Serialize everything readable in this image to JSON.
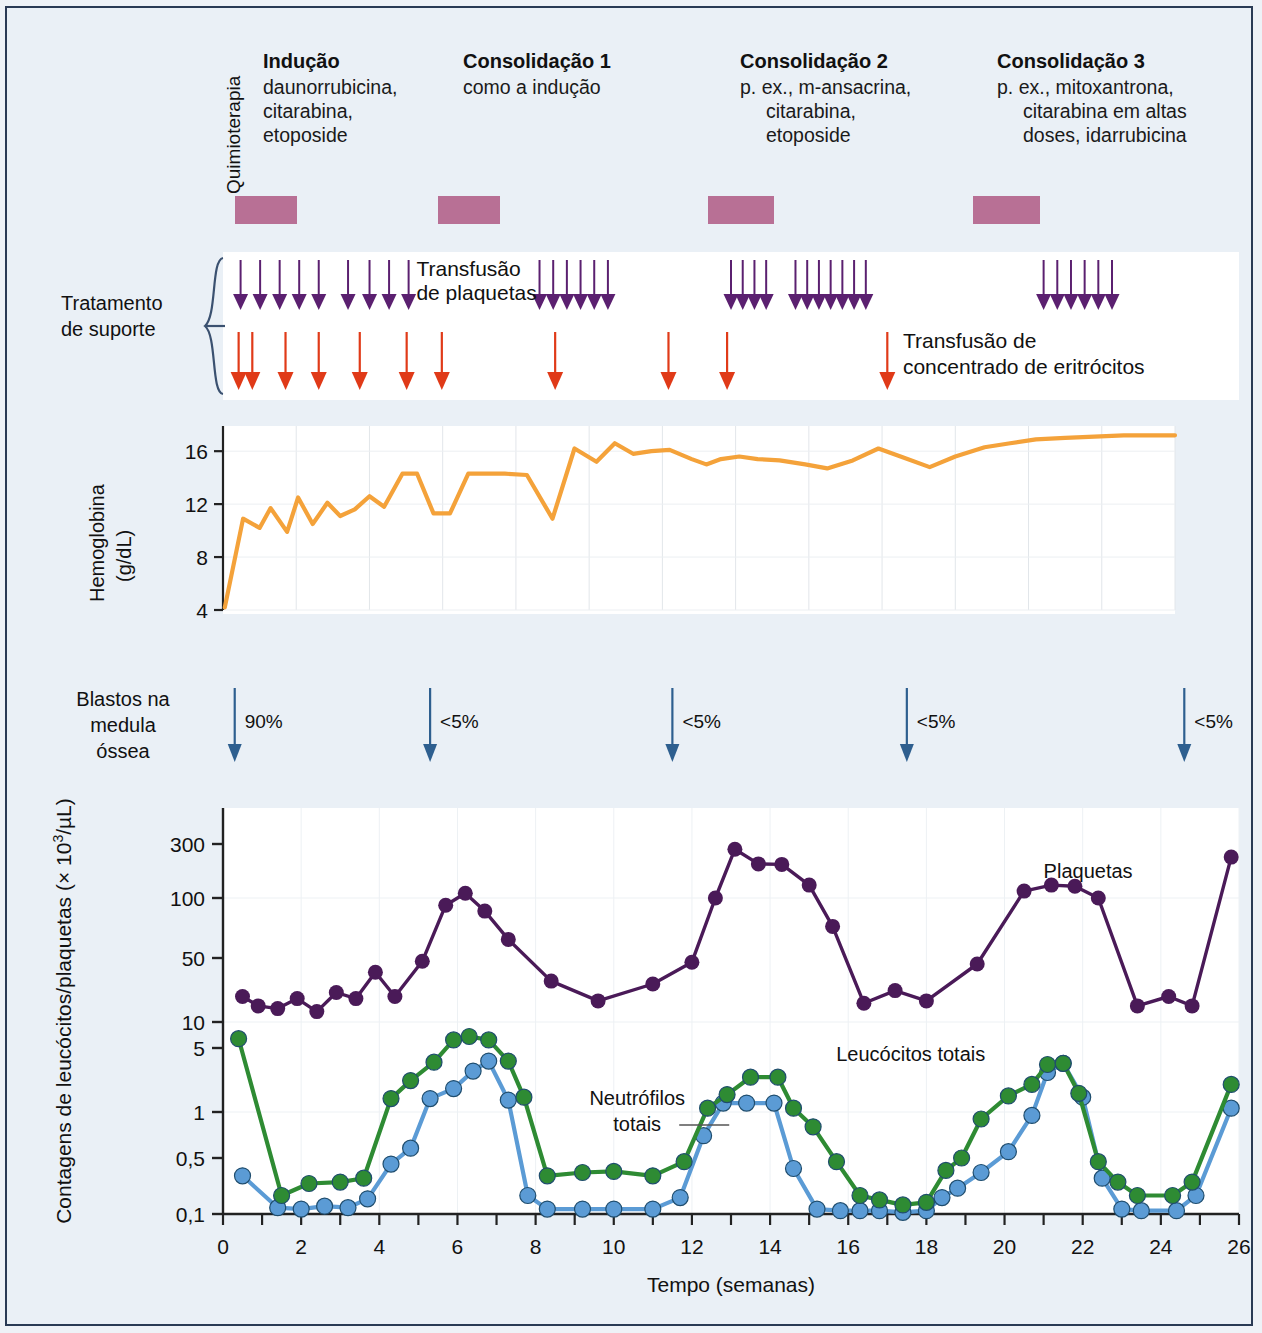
{
  "figure": {
    "background": "#eaf0f6",
    "border_color": "#2a3b55"
  },
  "chemo_section": {
    "axis_label": "Quimioterapia",
    "bar_color": "#b5688f",
    "cycles": [
      {
        "title": "Indução",
        "lines": [
          "daunorrubicina,",
          "citarabina,",
          "etoposide"
        ],
        "align": "left",
        "week_start": 0.3,
        "week_end": 1.9
      },
      {
        "title": "Consolidação 1",
        "lines": [
          "como a indução"
        ],
        "align": "left",
        "week_start": 5.5,
        "week_end": 7.1
      },
      {
        "title": "Consolidação 2",
        "lines": [
          "p. ex., m-ansacrina,",
          "citarabina,",
          "etoposide"
        ],
        "align": "right",
        "week_start": 12.4,
        "week_end": 14.1
      },
      {
        "title": "Consolidação 3",
        "lines": [
          "p. ex., mitoxantrona,",
          "citarabina em altas",
          "doses, idarrubicina"
        ],
        "align": "right",
        "week_start": 19.2,
        "week_end": 20.9
      }
    ]
  },
  "support_section": {
    "label_lines": [
      "Tratamento",
      "de suporte"
    ],
    "platelet": {
      "legend_lines": [
        "Transfusão",
        "de plaquetas"
      ],
      "color": "#5b2070",
      "weeks": [
        0.45,
        0.95,
        1.45,
        1.95,
        2.45,
        3.2,
        3.75,
        4.25,
        4.75,
        8.1,
        8.45,
        8.8,
        9.15,
        9.5,
        9.85,
        13.0,
        13.3,
        13.6,
        13.9,
        14.65,
        14.95,
        15.25,
        15.55,
        15.85,
        16.15,
        16.45,
        21.0,
        21.35,
        21.7,
        22.05,
        22.4,
        22.75
      ]
    },
    "erythrocyte": {
      "legend_lines": [
        "Transfusão de",
        "concentrado de eritrócitos"
      ],
      "color": "#e03a18",
      "weeks": [
        0.4,
        0.75,
        1.6,
        2.45,
        3.5,
        4.7,
        5.6,
        8.5,
        11.4,
        12.9
      ]
    }
  },
  "hemoglobin_chart": {
    "axis_label_lines": [
      "Hemoglobina",
      "(g/dL)"
    ],
    "line_color": "#f4a23a",
    "yticks": [
      4,
      8,
      12,
      16
    ],
    "ylim": [
      4,
      17.6
    ],
    "xlim": [
      0,
      26
    ]
  },
  "blast_section": {
    "label_lines": [
      "Blastos na",
      "medula",
      "óssea"
    ],
    "arrow_color": "#2e5f8f",
    "markers": [
      {
        "week": 0.3,
        "value": "90%"
      },
      {
        "week": 5.3,
        "value": "<5%"
      },
      {
        "week": 11.5,
        "value": "<5%"
      },
      {
        "week": 17.5,
        "value": "<5%"
      },
      {
        "week": 24.6,
        "value": "<5%"
      }
    ]
  },
  "chart_data": {
    "type": "line",
    "title": "",
    "xlabel": "Tempo (semanas)",
    "ylabel": "Contagens de leucócitos/plaquetas (× 10³/µL)",
    "ylabel_main": "Contagens de leucócitos/plaquetas (",
    "ylabel_sup": "3",
    "ylabel_tail": "/µL)",
    "yscale": "log",
    "ylim": [
      0.1,
      300
    ],
    "yticks": [
      0.1,
      0.5,
      1,
      5,
      10,
      50,
      100,
      300
    ],
    "yticklabels": [
      "0,1",
      "0,5",
      "1",
      "5",
      "10",
      "50",
      "100",
      "300"
    ],
    "xlim": [
      0,
      26
    ],
    "xticks": [
      0,
      1,
      2,
      3,
      4,
      5,
      6,
      7,
      8,
      9,
      10,
      11,
      12,
      13,
      14,
      15,
      16,
      17,
      18,
      19,
      20,
      21,
      22,
      23,
      24,
      25,
      26
    ],
    "xticklabels": [
      "0",
      "",
      "2",
      "",
      "4",
      "",
      "6",
      "",
      "8",
      "",
      "10",
      "",
      "12",
      "",
      "14",
      "",
      "16",
      "",
      "18",
      "",
      "20",
      "",
      "22",
      "",
      "24",
      "",
      "26"
    ],
    "grid": true,
    "legend_position": "inline-annotations",
    "series": [
      {
        "name": "Plaquetas",
        "color": "#4a1a58",
        "label_week": 21.0,
        "label_value": 150,
        "x": [
          0.5,
          0.9,
          1.4,
          1.9,
          2.4,
          2.9,
          3.4,
          3.9,
          4.4,
          5.1,
          5.7,
          6.2,
          6.7,
          7.3,
          8.4,
          9.6,
          11.0,
          12.0,
          12.6,
          13.1,
          13.7,
          14.3,
          15.0,
          15.6,
          16.4,
          17.2,
          18.0,
          19.3,
          20.5,
          21.2,
          21.8,
          22.4,
          23.4,
          24.2,
          24.8,
          25.8
        ],
        "y": [
          19,
          15,
          14,
          18,
          13,
          21,
          18,
          35,
          19,
          46,
          92,
          110,
          86,
          62,
          28,
          17,
          26,
          45,
          100,
          270,
          200,
          198,
          130,
          72,
          16,
          22,
          17,
          43,
          115,
          130,
          127,
          100,
          15,
          19,
          15,
          230
        ]
      },
      {
        "name": "Leucócitos totais",
        "color": "#2e8b33",
        "label_week": 17.6,
        "label_value": 3.6,
        "x": [
          0.4,
          1.5,
          2.2,
          3.0,
          3.6,
          4.3,
          4.8,
          5.4,
          5.9,
          6.3,
          6.8,
          7.3,
          7.7,
          8.3,
          9.2,
          10.0,
          11.0,
          11.8,
          12.4,
          12.9,
          13.5,
          14.2,
          14.6,
          15.1,
          15.7,
          16.3,
          16.8,
          17.4,
          18.0,
          18.5,
          18.9,
          19.4,
          20.1,
          20.7,
          21.1,
          21.5,
          21.9,
          22.4,
          22.9,
          23.4,
          24.3,
          24.8,
          25.8
        ],
        "y": [
          6.4,
          0.17,
          0.24,
          0.25,
          0.28,
          1.4,
          2.2,
          3.5,
          6.2,
          6.8,
          6.2,
          3.6,
          1.45,
          0.3,
          0.33,
          0.34,
          0.3,
          0.45,
          1.1,
          1.55,
          2.4,
          2.4,
          1.1,
          0.8,
          0.45,
          0.17,
          0.15,
          0.13,
          0.14,
          0.35,
          0.5,
          0.9,
          1.5,
          2.0,
          3.3,
          3.4,
          1.6,
          0.45,
          0.25,
          0.17,
          0.17,
          0.25,
          2.0
        ]
      },
      {
        "name": "Neutrófilos totais",
        "color": "#5b9bd5",
        "label_week": 10.6,
        "label_value": 0.9,
        "x": [
          0.5,
          1.4,
          2.0,
          2.6,
          3.2,
          3.7,
          4.3,
          4.8,
          5.3,
          5.9,
          6.4,
          6.8,
          7.3,
          7.8,
          8.3,
          9.2,
          10.0,
          11.0,
          11.7,
          12.3,
          12.8,
          13.4,
          14.1,
          14.6,
          15.2,
          15.8,
          16.3,
          16.8,
          17.4,
          18.0,
          18.4,
          18.8,
          19.4,
          20.1,
          20.7,
          21.1,
          21.5,
          22.0,
          22.5,
          23.0,
          23.5,
          24.4,
          24.9,
          25.8
        ],
        "y": [
          0.3,
          0.12,
          0.115,
          0.125,
          0.12,
          0.155,
          0.42,
          0.58,
          1.4,
          1.8,
          2.8,
          3.6,
          1.35,
          0.17,
          0.115,
          0.115,
          0.115,
          0.115,
          0.16,
          0.7,
          1.25,
          1.25,
          1.25,
          0.37,
          0.115,
          0.11,
          0.11,
          0.11,
          0.105,
          0.11,
          0.16,
          0.21,
          0.33,
          0.55,
          0.95,
          2.7,
          3.4,
          1.45,
          0.28,
          0.115,
          0.11,
          0.11,
          0.17,
          1.1
        ]
      }
    ],
    "annotations": [
      {
        "text": "Plaquetas",
        "series": "Plaquetas"
      },
      {
        "text": "Leucócitos totais",
        "series": "Leucócitos totais"
      },
      {
        "text": "Neutrófilos\ntotais",
        "series": "Neutrófilos totais",
        "line1": "Neutrófilos",
        "line2": "totais"
      }
    ]
  }
}
